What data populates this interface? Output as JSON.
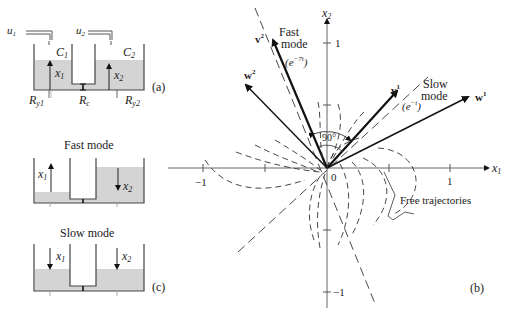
{
  "panel_a": {
    "label": "(a)",
    "inputs": [
      "u",
      "u"
    ],
    "input_subs": [
      "1",
      "2"
    ],
    "tanks": [
      "C",
      "C"
    ],
    "tank_subs": [
      "1",
      "2"
    ],
    "levels": [
      "x",
      "x"
    ],
    "level_subs": [
      "1",
      "2"
    ],
    "resistors": {
      "left": "R",
      "left_sub": "y1",
      "middle": "R",
      "middle_sub": "c",
      "right": "R",
      "right_sub": "y2"
    }
  },
  "panel_fast": {
    "title": "Fast mode",
    "levels": [
      "x",
      "x"
    ],
    "level_subs": [
      "1",
      "2"
    ]
  },
  "panel_slow": {
    "title": "Slow mode",
    "label": "(c)",
    "levels": [
      "x",
      "x"
    ],
    "level_subs": [
      "1",
      "2"
    ]
  },
  "panel_b": {
    "label": "(b)",
    "axes": {
      "x_label": "x",
      "x_sub": "1",
      "y_label": "x",
      "y_sub": "2",
      "x_ticks": [
        "−1",
        "1"
      ],
      "y_ticks": [
        "1",
        "−1"
      ],
      "origin": "0"
    },
    "vectors": {
      "v2": "v",
      "v2_sup": "2",
      "w2": "w",
      "w2_sup": "2",
      "v1": "v",
      "v1_sup": "1",
      "w1": "w",
      "w1_sup": "1"
    },
    "fast_mode": {
      "line1": "Fast",
      "line2": "mode",
      "rate": "(e",
      "rate_exp": "−7t",
      "rate_close": ")"
    },
    "slow_mode": {
      "line1": "Slow",
      "line2": "mode",
      "rate": "(e",
      "rate_exp": "−t",
      "rate_close": ")"
    },
    "angle": "90°",
    "annotation": "Free trajectories"
  }
}
